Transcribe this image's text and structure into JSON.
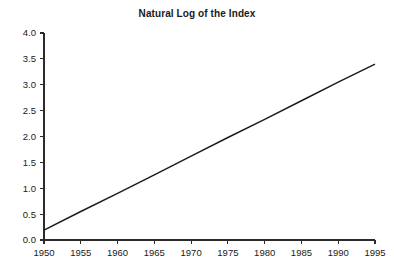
{
  "chart_data": {
    "type": "line",
    "title": "Natural Log of the Index",
    "xlabel": "",
    "ylabel": "",
    "xlim": [
      1950,
      1995
    ],
    "ylim": [
      0.0,
      4.0
    ],
    "grid": false,
    "legend": false,
    "x_ticks": [
      1950,
      1955,
      1960,
      1965,
      1970,
      1975,
      1980,
      1985,
      1990,
      1995
    ],
    "x_tick_labels": [
      "1950",
      "1955",
      "1960",
      "1965",
      "1970",
      "1975",
      "1980",
      "1985",
      "1990",
      "1995"
    ],
    "y_ticks": [
      0.0,
      0.5,
      1.0,
      1.5,
      2.0,
      2.5,
      3.0,
      3.5,
      4.0
    ],
    "y_tick_labels": [
      "0.0",
      "0.5",
      "1.0",
      "1.5",
      "2.0",
      "2.5",
      "3.0",
      "3.5",
      "4.0"
    ],
    "series": [
      {
        "name": "Natural Log of the Index",
        "color": "#1c1c1c",
        "x": [
          1950,
          1955,
          1960,
          1965,
          1970,
          1975,
          1980,
          1985,
          1990,
          1995
        ],
        "values": [
          0.19,
          0.55,
          0.9,
          1.26,
          1.62,
          1.98,
          2.33,
          2.69,
          3.05,
          3.4
        ]
      }
    ]
  },
  "style": {
    "background": "#ffffff",
    "axis_color": "#2b2b2b",
    "text_color": "#1a1a1a",
    "line_color": "#1c1c1c"
  }
}
